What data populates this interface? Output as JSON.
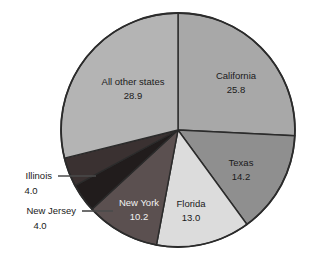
{
  "chart_data": {
    "type": "pie",
    "title": "",
    "subtitle": "",
    "xlabel": "",
    "ylabel": "",
    "legend_position": "none",
    "grid": false,
    "units": "percent",
    "categories": [
      "California",
      "Texas",
      "Florida",
      "New York",
      "New Jersey",
      "Illinois",
      "All other states"
    ],
    "values": [
      25.8,
      14.2,
      13.0,
      10.2,
      4.0,
      4.0,
      28.9
    ],
    "labels": [
      "25.8",
      "14.2",
      "13.0",
      "10.2",
      "4.0",
      "4.0",
      "28.9"
    ],
    "colors": [
      "#a8a8a8",
      "#8f8f8f",
      "#dcdcdc",
      "#5b5050",
      "#211c1c",
      "#3a3131",
      "#b4b4b4"
    ],
    "start_angle_deg": 0,
    "direction": "clockwise",
    "slices": [
      {
        "name": "California",
        "value": 25.8,
        "value_text": "25.8",
        "color": "#a8a8a8",
        "label_placement": "inside",
        "label_tone": "on-light"
      },
      {
        "name": "Texas",
        "value": 14.2,
        "value_text": "14.2",
        "color": "#8f8f8f",
        "label_placement": "inside",
        "label_tone": "on-light"
      },
      {
        "name": "Florida",
        "value": 13.0,
        "value_text": "13.0",
        "color": "#dcdcdc",
        "label_placement": "inside",
        "label_tone": "on-light"
      },
      {
        "name": "New York",
        "value": 10.2,
        "value_text": "10.2",
        "color": "#5b5050",
        "label_placement": "inside",
        "label_tone": "on-dark"
      },
      {
        "name": "New Jersey",
        "value": 4.0,
        "value_text": "4.0",
        "color": "#211c1c",
        "label_placement": "callout-left",
        "label_tone": "on-light"
      },
      {
        "name": "Illinois",
        "value": 4.0,
        "value_text": "4.0",
        "color": "#3a3131",
        "label_placement": "callout-left",
        "label_tone": "on-light"
      },
      {
        "name": "All other states",
        "value": 28.9,
        "value_text": "28.9",
        "color": "#b4b4b4",
        "label_placement": "inside",
        "label_tone": "on-light"
      }
    ]
  },
  "figure": {
    "background_color": "#ffffff",
    "outline_color": "#2b2b2b",
    "caption_fragment": ""
  }
}
